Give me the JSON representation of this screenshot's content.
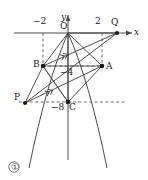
{
  "figure": {
    "caption": "①",
    "axes": {
      "x_axis_label": "x",
      "y_axis_label": "y",
      "origin_label": "O"
    },
    "tick_labels": [
      {
        "text": "−2",
        "axis": "x",
        "value": -2
      },
      {
        "text": "2",
        "axis": "x",
        "value": 2
      },
      {
        "text": "−4",
        "axis": "y",
        "value": -4
      },
      {
        "text": "−8",
        "axis": "y",
        "value": -8
      }
    ],
    "points": [
      {
        "name": "O",
        "label": "O",
        "x": 0,
        "y": 0
      },
      {
        "name": "Q",
        "label": "Q",
        "x": 4,
        "y": 0
      },
      {
        "name": "A",
        "label": "A",
        "x": 2,
        "y": -4
      },
      {
        "name": "B",
        "label": "B",
        "x": -2,
        "y": -4
      },
      {
        "name": "C",
        "label": "C",
        "x": 0,
        "y": -8
      },
      {
        "name": "P",
        "label": "P",
        "x": -3,
        "y": -8
      }
    ],
    "curve": {
      "type": "parabola",
      "description": "downward opening parabola through O",
      "equation": "y = -x^2"
    },
    "segments": [
      {
        "from": "O",
        "to": "Q"
      },
      {
        "from": "O",
        "to": "A"
      },
      {
        "from": "O",
        "to": "B"
      },
      {
        "from": "O",
        "to": "C"
      },
      {
        "from": "A",
        "to": "B"
      },
      {
        "from": "A",
        "to": "C"
      },
      {
        "from": "B",
        "to": "C"
      },
      {
        "from": "B",
        "to": "Q"
      },
      {
        "from": "P",
        "to": "Q"
      },
      {
        "from": "P",
        "to": "B"
      },
      {
        "from": "P",
        "to": "A"
      }
    ],
    "dashed": [
      {
        "type": "vertical",
        "at_x": -2,
        "label": "−2"
      },
      {
        "type": "vertical",
        "at_x": 2,
        "label": "2"
      },
      {
        "type": "horizontal",
        "at_y": -4,
        "label": "−4"
      },
      {
        "type": "horizontal",
        "at_y": -8,
        "label": "−8"
      }
    ],
    "parallel_markers": [
      {
        "on_segment": "B-Q",
        "marks": 2
      },
      {
        "on_segment": "P-A",
        "marks": 2
      }
    ],
    "colors": {
      "stroke": "#3c3c3c",
      "dashed": "#4a4a4a",
      "text": "#1a1a1a",
      "background": "#ffffff"
    }
  }
}
